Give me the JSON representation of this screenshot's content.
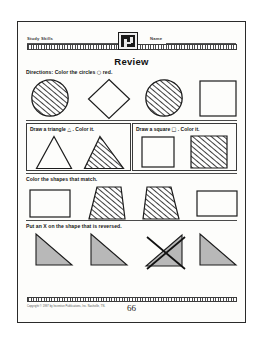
{
  "page": {
    "header": {
      "subject_label": "Study Skills",
      "name_label": "Name",
      "badge_icon": "book-badge-icon"
    },
    "title": "Review",
    "page_number": "66",
    "copyright": "Copyright © 1997 by Incentive Publications, Inc. Nashville, TN."
  },
  "sections": [
    {
      "id": "circles",
      "instruction_lead": "Directions:",
      "instruction_text": "Color the circles",
      "instruction_glyph": "○",
      "instruction_tail": "red.",
      "shapes": [
        {
          "name": "circle",
          "fill": "hatched"
        },
        {
          "name": "diamond",
          "fill": "empty"
        },
        {
          "name": "circle",
          "fill": "hatched"
        },
        {
          "name": "square",
          "fill": "empty"
        }
      ]
    },
    {
      "id": "draw-boxes",
      "boxes": [
        {
          "label_text_a": "Draw a triangle",
          "label_glyph": "△",
          "label_text_b": ". Color it.",
          "shapes": [
            {
              "name": "triangle",
              "fill": "empty"
            },
            {
              "name": "triangle",
              "fill": "hatched"
            }
          ]
        },
        {
          "label_text_a": "Draw a square",
          "label_glyph": "□",
          "label_text_b": ". Color it.",
          "shapes": [
            {
              "name": "square",
              "fill": "empty"
            },
            {
              "name": "square",
              "fill": "hatched"
            }
          ]
        }
      ]
    },
    {
      "id": "match",
      "instruction_text": "Color the shapes that match.",
      "shapes": [
        {
          "name": "rectangle",
          "fill": "empty"
        },
        {
          "name": "trapezoid",
          "fill": "hatched",
          "orientation": "normal"
        },
        {
          "name": "trapezoid",
          "fill": "hatched",
          "orientation": "mirrored"
        },
        {
          "name": "rectangle",
          "fill": "empty"
        }
      ]
    },
    {
      "id": "reversed",
      "instruction_text": "Put an X on the shape that is reversed.",
      "shapes": [
        {
          "name": "right-triangle",
          "fill": "shaded",
          "orientation": "normal",
          "marked": false
        },
        {
          "name": "right-triangle",
          "fill": "shaded",
          "orientation": "normal",
          "marked": false
        },
        {
          "name": "right-triangle",
          "fill": "shaded",
          "orientation": "mirrored",
          "marked": true
        },
        {
          "name": "right-triangle",
          "fill": "shaded",
          "orientation": "normal",
          "marked": false
        }
      ]
    }
  ],
  "colors": {
    "ink": "#1c1c1c",
    "rule": "#4a4a4a",
    "shade": "#b8b8b8",
    "paper": "#fdfdfb"
  }
}
